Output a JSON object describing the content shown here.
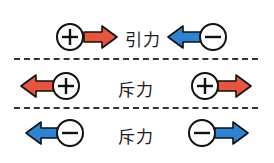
{
  "colors": {
    "positive_arrow": "#e8553a",
    "negative_arrow": "#2a86d4",
    "outline": "#111111"
  },
  "rows": [
    {
      "label": "引力",
      "meaning": "attraction",
      "left": {
        "charge": "+",
        "arrow": "right"
      },
      "right": {
        "charge": "−",
        "arrow": "left"
      }
    },
    {
      "label": "斥力",
      "meaning": "repulsion",
      "left": {
        "charge": "+",
        "arrow": "left"
      },
      "right": {
        "charge": "+",
        "arrow": "right"
      }
    },
    {
      "label": "斥力",
      "meaning": "repulsion",
      "left": {
        "charge": "−",
        "arrow": "left"
      },
      "right": {
        "charge": "−",
        "arrow": "right"
      }
    }
  ]
}
